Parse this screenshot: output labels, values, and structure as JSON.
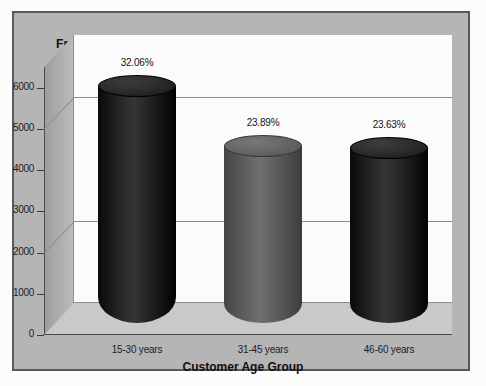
{
  "chart_data": {
    "type": "bar",
    "title": "",
    "xlabel": "Customer Age Group",
    "ylabel": "Frequency",
    "categories": [
      "15-30 years",
      "31-45 years",
      "46-60 years"
    ],
    "values": [
      5750,
      4285,
      4240
    ],
    "data_labels": [
      "32.06%",
      "23.89%",
      "23.63%"
    ],
    "percentages": [
      32.06,
      23.89,
      23.63
    ],
    "ylim": [
      0,
      6500
    ],
    "yticks": [
      0,
      1000,
      2000,
      3000,
      4000,
      5000,
      6000
    ],
    "ytick_labels": [
      "0",
      "1000",
      "2000",
      "3000",
      "4000",
      "5000",
      "6000"
    ],
    "gridlines": [
      2000,
      5000
    ],
    "grid": true,
    "legend": "none",
    "style": "3d-cylinder",
    "bar_colors": [
      "#1b1b1b",
      "#565656",
      "#1c1c1c"
    ],
    "panel_color": "#b5b5b5",
    "wall_color": "#fbfbfb",
    "floor_color": "#c9c9c9",
    "border_color": "#555a5d",
    "text_color": "#1d1d1d"
  },
  "axes": {
    "y_title": "Frequency",
    "x_title": "Customer Age Group"
  }
}
